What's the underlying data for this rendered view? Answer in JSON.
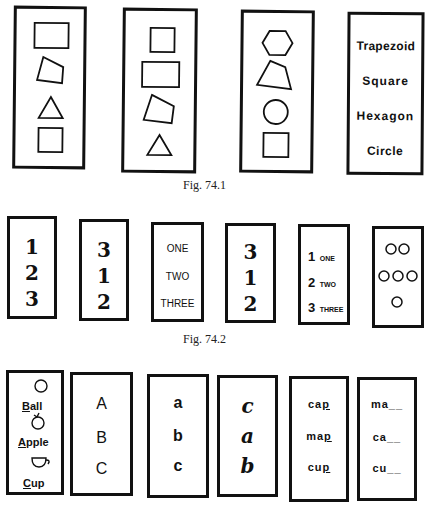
{
  "fig1": {
    "caption": "Fig. 74.1",
    "cards": [
      {
        "shapes": [
          "rectangle",
          "trapezoid",
          "triangle",
          "square"
        ]
      },
      {
        "shapes": [
          "square",
          "rectangle",
          "trapezoid",
          "triangle"
        ]
      },
      {
        "shapes": [
          "hexagon",
          "trapezoid",
          "circle",
          "square"
        ]
      },
      {
        "words": [
          "Trapezoid",
          "Square",
          "Hexagon",
          "Circle"
        ]
      }
    ]
  },
  "fig2": {
    "caption": "Fig. 74.2",
    "cards": [
      {
        "items": [
          "1",
          "2",
          "3"
        ]
      },
      {
        "items": [
          "3",
          "1",
          "2"
        ]
      },
      {
        "items": [
          "ONE",
          "TWO",
          "THREE"
        ]
      },
      {
        "items": [
          "3",
          "1",
          "2"
        ]
      },
      {
        "numbers": [
          "1",
          "2",
          "3"
        ],
        "words": [
          "ONE",
          "TWO",
          "THREE"
        ]
      },
      {
        "dot_rows": [
          2,
          3,
          1
        ]
      }
    ]
  },
  "fig3": {
    "cards": [
      {
        "pictures": [
          {
            "icon": "ball-icon",
            "initial": "B",
            "rest": "all"
          },
          {
            "icon": "apple-icon",
            "initial": "A",
            "rest": "pple"
          },
          {
            "icon": "cup-icon",
            "initial": "C",
            "rest": "up"
          }
        ]
      },
      {
        "items": [
          "A",
          "B",
          "C"
        ]
      },
      {
        "items": [
          "a",
          "b",
          "c"
        ]
      },
      {
        "items": [
          "c",
          "a",
          "b"
        ]
      },
      {
        "words": [
          {
            "stem": "ca",
            "end": "p"
          },
          {
            "stem": "ma",
            "end": "p"
          },
          {
            "stem": "cu",
            "end": "p"
          }
        ]
      },
      {
        "blanks": [
          "ma__",
          "ca__",
          "cu__"
        ]
      }
    ]
  }
}
